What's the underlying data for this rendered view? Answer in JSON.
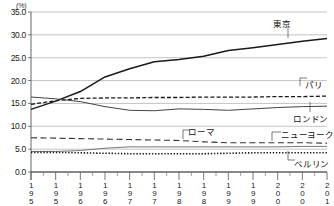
{
  "chart_data": {
    "type": "line",
    "title": "",
    "subtitle": "",
    "unit_label": "(%)",
    "xlabel": "",
    "ylabel": "",
    "ylim": [
      0.0,
      35.0
    ],
    "xlim": [
      1950,
      2010
    ],
    "grid": true,
    "legend_position": "inline-annotations",
    "y_ticks": [
      "0.0",
      "5.0",
      "10.0",
      "15.0",
      "20.0",
      "25.0",
      "30.0",
      "35.0"
    ],
    "y_tick_values": [
      0.0,
      5.0,
      10.0,
      15.0,
      20.0,
      25.0,
      30.0,
      35.0
    ],
    "categories": [
      "1950",
      "1955",
      "1960",
      "1965",
      "1970",
      "1975",
      "1980",
      "1985",
      "1990",
      "1995",
      "2000",
      "2005",
      "2010"
    ],
    "x": [
      1950,
      1955,
      1960,
      1965,
      1970,
      1975,
      1980,
      1985,
      1990,
      1995,
      2000,
      2005,
      2010
    ],
    "series": [
      {
        "name": "東京",
        "style": "solid-thick",
        "color": "#1a1a1a",
        "values": [
          13.7,
          15.5,
          17.6,
          20.8,
          22.6,
          24.1,
          24.6,
          25.3,
          26.6,
          27.2,
          27.9,
          28.6,
          29.2
        ]
      },
      {
        "name": "パリ",
        "style": "dashed",
        "color": "#1a1a1a",
        "values": [
          14.8,
          15.6,
          16.1,
          16.2,
          16.2,
          16.3,
          16.3,
          16.4,
          16.4,
          16.4,
          16.5,
          16.5,
          16.6
        ]
      },
      {
        "name": "ロンドン",
        "style": "solid-thin",
        "color": "#444444",
        "values": [
          16.4,
          16.0,
          15.4,
          14.3,
          13.5,
          13.4,
          13.8,
          13.7,
          13.5,
          13.8,
          14.1,
          14.3,
          14.4
        ]
      },
      {
        "name": "ローマ",
        "style": "long-dash",
        "color": "#333333",
        "values": [
          7.5,
          7.4,
          7.3,
          7.2,
          7.1,
          7.0,
          6.9,
          6.6,
          6.4,
          6.4,
          6.4,
          6.4,
          6.3
        ]
      },
      {
        "name": "ニューヨーク",
        "style": "solid-thin-gray",
        "color": "#777777",
        "values": [
          4.5,
          4.5,
          4.7,
          5.2,
          5.5,
          5.5,
          5.5,
          5.5,
          5.5,
          5.5,
          5.5,
          5.6,
          5.6
        ]
      },
      {
        "name": "ベルリン",
        "style": "dotted",
        "color": "#1a1a1a",
        "values": [
          4.3,
          4.3,
          4.2,
          4.1,
          4.0,
          4.0,
          4.0,
          4.0,
          4.1,
          4.2,
          4.2,
          4.2,
          4.2
        ]
      }
    ],
    "annotations": [
      {
        "label": "東京",
        "left": 273,
        "top": 17
      },
      {
        "label": "パリ",
        "left": 305,
        "top": 78
      },
      {
        "label": "ロンドン",
        "left": 293,
        "top": 112
      },
      {
        "label": "ローマ",
        "left": 188,
        "top": 125
      },
      {
        "label": "ニューヨーク",
        "left": 281,
        "top": 128
      },
      {
        "label": "ベルリン",
        "left": 294,
        "top": 157
      }
    ]
  }
}
